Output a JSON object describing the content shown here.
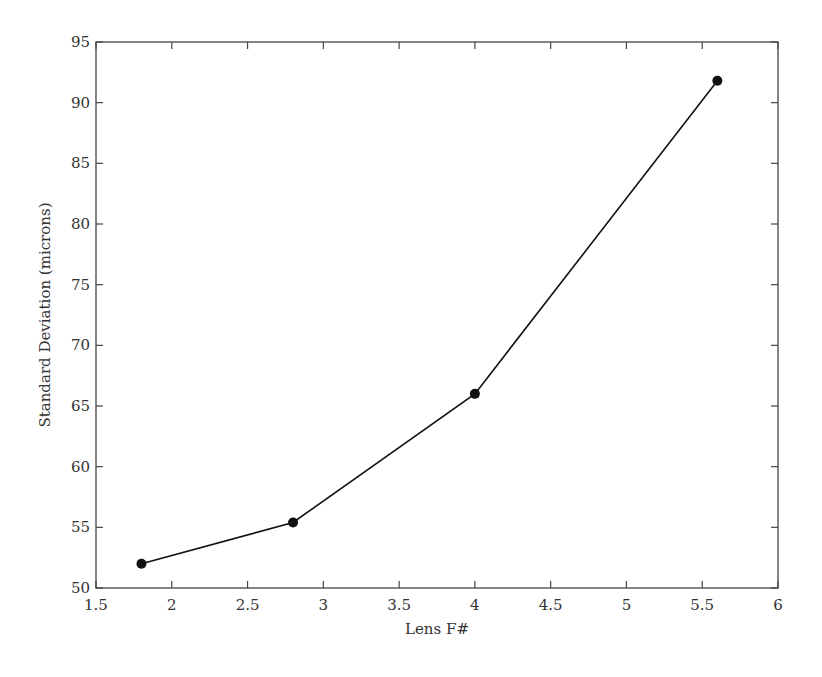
{
  "chart_data": {
    "type": "line",
    "title": "",
    "xlabel": "Lens F#",
    "ylabel": "Standard Deviation (microns)",
    "xlim": [
      1.5,
      6
    ],
    "ylim": [
      50,
      95
    ],
    "xticks": [
      1.5,
      2,
      2.5,
      3,
      3.5,
      4,
      4.5,
      5,
      5.5,
      6
    ],
    "xtick_labels": [
      "1.5",
      "2",
      "2.5",
      "3",
      "3.5",
      "4",
      "4.5",
      "5",
      "5.5",
      "6"
    ],
    "yticks": [
      50,
      55,
      60,
      65,
      70,
      75,
      80,
      85,
      90,
      95
    ],
    "ytick_labels": [
      "50",
      "55",
      "60",
      "65",
      "70",
      "75",
      "80",
      "85",
      "90",
      "95"
    ],
    "grid": false,
    "legend": null,
    "series": [
      {
        "name": "Standard Deviation",
        "x": [
          1.8,
          2.8,
          4.0,
          5.6
        ],
        "y": [
          52.0,
          55.4,
          66.0,
          91.8
        ],
        "marker": "filled-circle",
        "color": "#111111"
      }
    ]
  }
}
